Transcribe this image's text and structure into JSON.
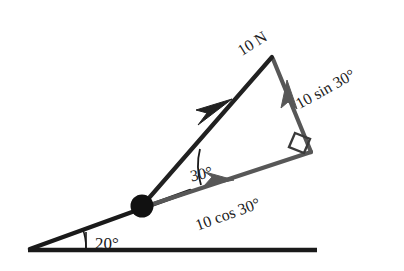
{
  "figure": {
    "colors": {
      "incline": "#1a1a1a",
      "ground": "#1a1a1a",
      "force_vector": "#262626",
      "component_vector": "#575757",
      "ball": "#111111",
      "text": "#1a1a1a",
      "background": "#ffffff"
    },
    "labels": {
      "force": "10 N",
      "sin_component": "10 sin 30°",
      "cos_component": "10 cos 30°",
      "angle_force_incline": "30°",
      "angle_incline_ground": "20°"
    },
    "label_rotations": {
      "force": -32,
      "sin_component": -29,
      "cos_component": -20,
      "angle_force_incline": -12,
      "angle_incline_ground": 0
    },
    "geometry": {
      "ground_start_x": 28,
      "ground_end_x": 317,
      "ground_y": 250,
      "incline_apex_x": 30,
      "incline_apex_y": 249,
      "ball_x": 142,
      "ball_y": 206,
      "ball_radius": 11,
      "force_tip_x": 272,
      "force_tip_y": 57,
      "corner_x": 311,
      "corner_y": 152,
      "incline_angle_deg": 20,
      "force_angle_from_incline_deg": 30
    },
    "elements": {
      "ball_name": "ball-particle",
      "ground_name": "ground-line",
      "incline_name": "incline-line"
    }
  }
}
